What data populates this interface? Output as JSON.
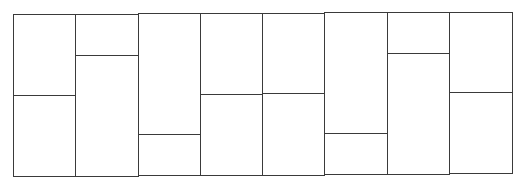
{
  "diagram": {
    "type": "rectangle-partition",
    "stroke_color": "#3a3a3a",
    "background": "#ffffff",
    "columns": [
      {
        "x0": 13,
        "x1": 75,
        "top": 14,
        "bottom": 176,
        "split": 95
      },
      {
        "x0": 75,
        "x1": 138,
        "top": 14,
        "bottom": 176,
        "split": 55
      },
      {
        "x0": 138,
        "x1": 200,
        "top": 13,
        "bottom": 175,
        "split": 134
      },
      {
        "x0": 200,
        "x1": 262,
        "top": 13,
        "bottom": 175,
        "split": 94
      },
      {
        "x0": 262,
        "x1": 324,
        "top": 13,
        "bottom": 175,
        "split": 93
      },
      {
        "x0": 324,
        "x1": 387,
        "top": 12,
        "bottom": 174,
        "split": 133
      },
      {
        "x0": 387,
        "x1": 449,
        "top": 12,
        "bottom": 174,
        "split": 53
      },
      {
        "x0": 449,
        "x1": 512,
        "top": 12,
        "bottom": 173,
        "split": 92
      }
    ]
  }
}
